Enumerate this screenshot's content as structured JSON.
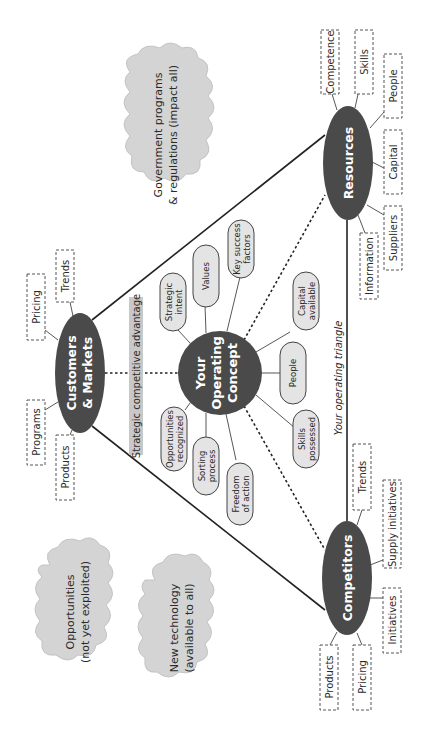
{
  "diagram": {
    "title": "Your operating triangle",
    "orientation": "rotated -90deg (text reads bottom-to-top)",
    "core": {
      "label_lines": [
        "Your",
        "Operating",
        "Concept"
      ]
    },
    "core_attributes": [
      {
        "id": "strategic-intent",
        "lines": [
          "Strategic",
          "intent"
        ]
      },
      {
        "id": "values",
        "lines": [
          "Values"
        ]
      },
      {
        "id": "key-success-factors",
        "lines": [
          "Key success",
          "factors"
        ]
      },
      {
        "id": "capital-available",
        "lines": [
          "Capital",
          "available"
        ]
      },
      {
        "id": "people",
        "lines": [
          "People"
        ]
      },
      {
        "id": "skills-possessed",
        "lines": [
          "Skills",
          "possessed"
        ]
      },
      {
        "id": "freedom-of-action",
        "lines": [
          "Freedom",
          "of action"
        ]
      },
      {
        "id": "sorting-process",
        "lines": [
          "Sorting",
          "process"
        ]
      },
      {
        "id": "opportunities-recognized",
        "lines": [
          "Opportunities",
          "recognized"
        ]
      }
    ],
    "hubs": {
      "customers": {
        "label_lines": [
          "Customers",
          "& Markets"
        ],
        "items": [
          "Trends",
          "Pricing",
          "Programs",
          "Products"
        ]
      },
      "resources": {
        "label_lines": [
          "Resources"
        ],
        "items": [
          "Competence",
          "Skills",
          "People",
          "Capital",
          "Suppliers",
          "Information"
        ]
      },
      "competitors": {
        "label_lines": [
          "Competitors"
        ],
        "items": [
          "Trends",
          "Supply initiatives",
          "Initiatives",
          "Products",
          "Pricing"
        ]
      }
    },
    "edge_labels": {
      "strategic_advantage": "Strategic competitive advantage",
      "operating_triangle": "Your operating triangle"
    },
    "clouds": {
      "government": [
        "Government programs",
        "& regulations (impact all)"
      ],
      "opportunities": [
        "Opportunities",
        "(not yet exploited)"
      ],
      "new_technology": [
        "New technology",
        "(available to all)"
      ]
    },
    "colors": {
      "hub_fill": "#4a4a4a",
      "pill_fill": "#e4e4e4",
      "cloud_fill": "#d4d4d4",
      "band_fill": "#c8c8c8",
      "line": "#222222"
    }
  }
}
